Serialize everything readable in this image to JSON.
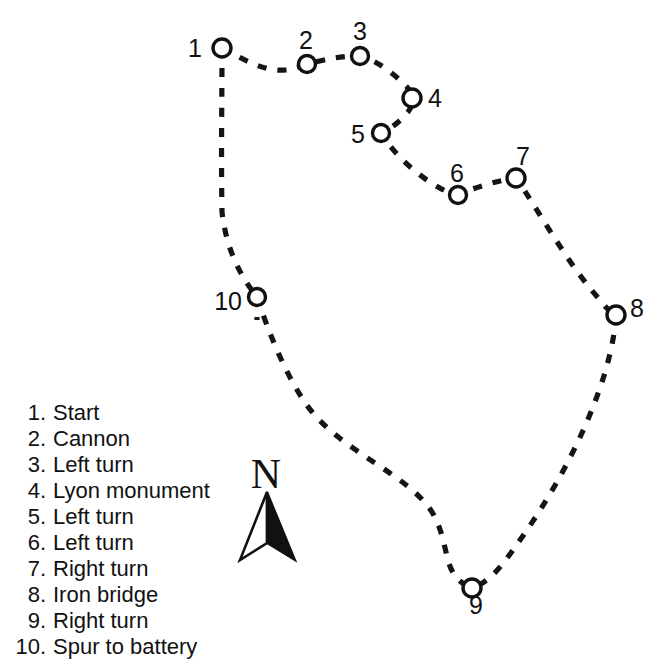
{
  "map": {
    "title": "Walking tour route map",
    "north_arrow": {
      "letter": "N"
    },
    "markers": [
      {
        "number": "1",
        "label": "Start",
        "cx": 222,
        "cy": 48,
        "r": 9,
        "label_x": 202,
        "label_y": 57,
        "anchor": "end"
      },
      {
        "number": "2",
        "label": "Cannon",
        "cx": 307,
        "cy": 64,
        "r": 8.5,
        "label_x": 306,
        "label_y": 49,
        "anchor": "middle"
      },
      {
        "number": "3",
        "label": "Left turn",
        "cx": 360,
        "cy": 56,
        "r": 8.5,
        "label_x": 360,
        "label_y": 40,
        "anchor": "middle"
      },
      {
        "number": "4",
        "label": "Lyon monument",
        "cx": 412,
        "cy": 98,
        "r": 9,
        "label_x": 428,
        "label_y": 107,
        "anchor": "start"
      },
      {
        "number": "5",
        "label": "Left turn",
        "cx": 381,
        "cy": 133,
        "r": 8.5,
        "label_x": 365,
        "label_y": 143,
        "anchor": "end"
      },
      {
        "number": "6",
        "label": "Left turn",
        "cx": 458,
        "cy": 195,
        "r": 8.5,
        "label_x": 457,
        "label_y": 182,
        "anchor": "middle"
      },
      {
        "number": "7",
        "label": "Right turn",
        "cx": 516,
        "cy": 178,
        "r": 9,
        "label_x": 523,
        "label_y": 165,
        "anchor": "middle"
      },
      {
        "number": "8",
        "label": "Iron bridge",
        "cx": 616,
        "cy": 315,
        "r": 9,
        "label_x": 630,
        "label_y": 317,
        "anchor": "start"
      },
      {
        "number": "9",
        "label": "Right turn",
        "cx": 472,
        "cy": 588,
        "r": 9,
        "label_x": 476,
        "label_y": 614,
        "anchor": "middle"
      },
      {
        "number": "10",
        "label": "Spur to battery",
        "cx": 257,
        "cy": 297,
        "r": 8.5,
        "label_x": 242,
        "label_y": 310,
        "anchor": "end"
      }
    ],
    "route_path": "M 222,48 C 238,56 262,72 285,70 C 296,69 300,66 307,64 C 330,58 344,56 360,56 C 376,60 392,72 406,86 C 414,94 414,104 408,112 C 400,122 390,129 381,133 C 392,152 420,180 450,193 C 454,195 457,195 462,193 C 480,186 500,180 516,178 C 536,206 566,262 600,300 C 606,308 610,312 616,315",
    "route_path_left": "M 222,48 C 222,98 221,160 222,212 C 226,248 240,276 257,297",
    "route_path_lower": "M 257,297 C 268,330 284,372 306,404 C 340,452 406,472 432,512 C 452,546 440,576 472,588",
    "route_path_right": "M 616,315 C 612,380 570,470 520,540 C 502,566 490,582 472,588",
    "spur_path": "M 257,297 L 257,320",
    "north_arrow_geometry": {
      "letter_x": 266,
      "letter_y": 488,
      "apex_x": 267,
      "apex_y": 492,
      "left_points": "267,492 240,560 267,543",
      "right_points": "267,492 295,560 267,543"
    }
  },
  "legend": {
    "items": [
      {
        "number": "1.",
        "label": "Start"
      },
      {
        "number": "2.",
        "label": "Cannon"
      },
      {
        "number": "3.",
        "label": "Left turn"
      },
      {
        "number": "4.",
        "label": "Lyon monument"
      },
      {
        "number": "5.",
        "label": "Left turn"
      },
      {
        "number": "6.",
        "label": "Left turn"
      },
      {
        "number": "7.",
        "label": "Right turn"
      },
      {
        "number": "8.",
        "label": "Iron bridge"
      },
      {
        "number": "9.",
        "label": "Right turn"
      },
      {
        "number": "10.",
        "label": "Spur to battery"
      }
    ]
  },
  "colors": {
    "ink": "#111111",
    "background": "#ffffff"
  }
}
